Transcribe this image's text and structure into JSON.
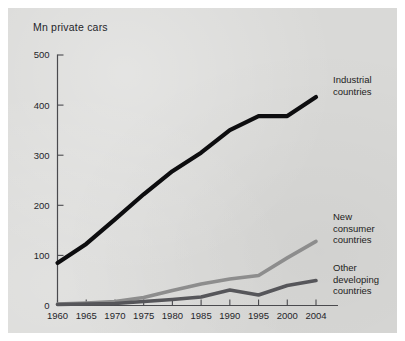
{
  "figure": {
    "background_color": "#ffffff",
    "panel_color": "#d9d9d7",
    "width": 405,
    "height": 341
  },
  "axis": {
    "y_axis_title": "Mn private cars",
    "y_ticks": [
      "0",
      "100",
      "200",
      "300",
      "400",
      "500"
    ],
    "x_ticks": [
      "1960",
      "1965",
      "1970",
      "1975",
      "1980",
      "1985",
      "1990",
      "1995",
      "2000",
      "2004"
    ],
    "axis_color": "#4a4a4e"
  },
  "annotations": {
    "industrial_line1": "Industrial",
    "industrial_line2": "countries",
    "new_consumer_line1": "New",
    "new_consumer_line2": "consumer",
    "new_consumer_line3": "countries",
    "other_developing_line1": "Other",
    "other_developing_line2": "developing",
    "other_developing_line3": "countries"
  },
  "chart_data": {
    "type": "line",
    "title": "",
    "xlabel": "",
    "ylabel": "Mn private cars",
    "xlim": [
      1960,
      2004
    ],
    "ylim": [
      0,
      500
    ],
    "yticks": [
      0,
      100,
      200,
      300,
      400,
      500
    ],
    "xticks": [
      1960,
      1965,
      1970,
      1975,
      1980,
      1985,
      1990,
      1995,
      2000,
      2004
    ],
    "grid": false,
    "legend_position": "inline-right-labels",
    "x": [
      1960,
      1965,
      1970,
      1975,
      1980,
      1985,
      1990,
      1995,
      2000,
      2004
    ],
    "series": [
      {
        "name": "Industrial countries",
        "color": "#0d0d0f",
        "stroke_width": 4.2,
        "values": [
          85,
          123,
          172,
          222,
          268,
          305,
          350,
          378,
          378,
          416
        ]
      },
      {
        "name": "New consumer countries",
        "color": "#8d8d8d",
        "stroke_width": 3.6,
        "values": [
          3,
          5,
          8,
          16,
          30,
          43,
          53,
          60,
          95,
          128
        ]
      },
      {
        "name": "Other developing countries",
        "color": "#56565a",
        "stroke_width": 3.6,
        "values": [
          2,
          3,
          4,
          8,
          12,
          17,
          31,
          21,
          40,
          50
        ]
      }
    ]
  }
}
